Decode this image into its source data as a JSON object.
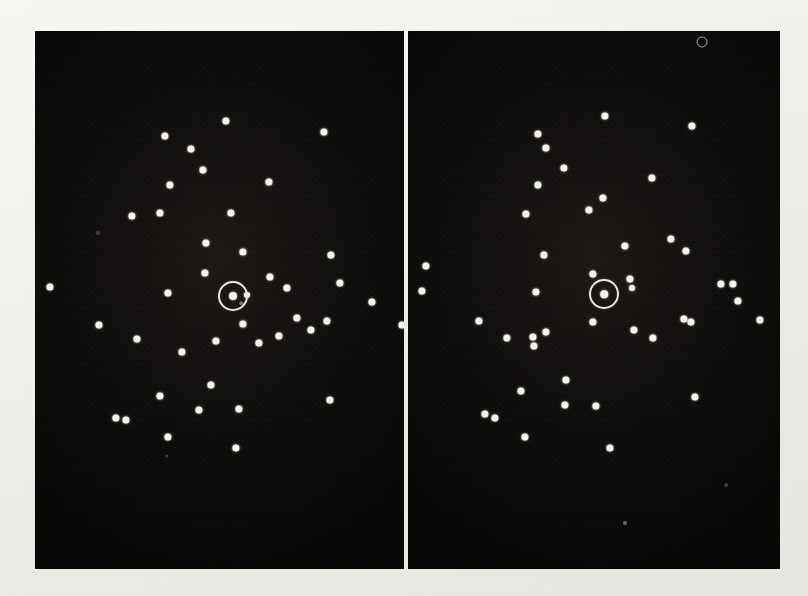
{
  "figure": {
    "kind": "electron-diffraction-plate",
    "width": 808,
    "height": 596,
    "paper_color": "#f1f0ec",
    "panel_color": "#0d0c0b",
    "spot_color": "#f4f3f0",
    "marker_color": "#ece9e3",
    "caption": "",
    "panel_count": 2
  },
  "panels": [
    {
      "id": "left-panel",
      "label": "",
      "x": 35,
      "y": 31,
      "width": 369,
      "height": 538,
      "marker": {
        "cx": 233,
        "cy": 296,
        "r": 13,
        "label": ""
      },
      "spots": [
        {
          "x": 165,
          "y": 136,
          "r": 3.6
        },
        {
          "x": 226,
          "y": 121,
          "r": 3.6
        },
        {
          "x": 324,
          "y": 132,
          "r": 3.6
        },
        {
          "x": 191,
          "y": 149,
          "r": 3.6
        },
        {
          "x": 203,
          "y": 170,
          "r": 3.6
        },
        {
          "x": 269,
          "y": 182,
          "r": 3.6
        },
        {
          "x": 170,
          "y": 185,
          "r": 3.6
        },
        {
          "x": 231,
          "y": 213,
          "r": 3.6
        },
        {
          "x": 160,
          "y": 213,
          "r": 3.6
        },
        {
          "x": 243,
          "y": 252,
          "r": 3.6
        },
        {
          "x": 331,
          "y": 255,
          "r": 3.6
        },
        {
          "x": 132,
          "y": 216,
          "r": 3.6
        },
        {
          "x": 206,
          "y": 243,
          "r": 3.6
        },
        {
          "x": 98,
          "y": 233,
          "r": 2.0,
          "class": "vfaint"
        },
        {
          "x": 270,
          "y": 277,
          "r": 3.6
        },
        {
          "x": 287,
          "y": 288,
          "r": 3.6
        },
        {
          "x": 340,
          "y": 283,
          "r": 3.6
        },
        {
          "x": 372,
          "y": 302,
          "r": 3.6
        },
        {
          "x": 205,
          "y": 273,
          "r": 3.6
        },
        {
          "x": 168,
          "y": 293,
          "r": 3.6
        },
        {
          "x": 233,
          "y": 296,
          "r": 4.0
        },
        {
          "x": 247,
          "y": 295,
          "r": 3.0
        },
        {
          "x": 241,
          "y": 303,
          "r": 1.8,
          "class": "faint"
        },
        {
          "x": 50,
          "y": 287,
          "r": 3.6
        },
        {
          "x": 99,
          "y": 325,
          "r": 3.6
        },
        {
          "x": 137,
          "y": 339,
          "r": 3.6
        },
        {
          "x": 243,
          "y": 324,
          "r": 3.6
        },
        {
          "x": 279,
          "y": 336,
          "r": 3.6
        },
        {
          "x": 311,
          "y": 330,
          "r": 3.6
        },
        {
          "x": 216,
          "y": 341,
          "r": 3.6
        },
        {
          "x": 182,
          "y": 352,
          "r": 3.6
        },
        {
          "x": 327,
          "y": 321,
          "r": 3.6
        },
        {
          "x": 259,
          "y": 343,
          "r": 3.6
        },
        {
          "x": 297,
          "y": 318,
          "r": 3.6
        },
        {
          "x": 402,
          "y": 325,
          "r": 3.6
        },
        {
          "x": 211,
          "y": 385,
          "r": 3.6
        },
        {
          "x": 160,
          "y": 396,
          "r": 3.6
        },
        {
          "x": 199,
          "y": 410,
          "r": 3.6
        },
        {
          "x": 239,
          "y": 409,
          "r": 3.6
        },
        {
          "x": 116,
          "y": 418,
          "r": 3.6
        },
        {
          "x": 126,
          "y": 420,
          "r": 3.6
        },
        {
          "x": 330,
          "y": 400,
          "r": 3.6
        },
        {
          "x": 168,
          "y": 437,
          "r": 3.6
        },
        {
          "x": 236,
          "y": 448,
          "r": 3.6
        },
        {
          "x": 167,
          "y": 456,
          "r": 1.6,
          "class": "vfaint"
        }
      ]
    },
    {
      "id": "right-panel",
      "label": "",
      "x": 408,
      "y": 31,
      "width": 372,
      "height": 538,
      "marker": {
        "cx": 604,
        "cy": 294,
        "r": 13,
        "label": ""
      },
      "spots": [
        {
          "x": 605,
          "y": 116,
          "r": 3.6
        },
        {
          "x": 692,
          "y": 126,
          "r": 3.6
        },
        {
          "x": 538,
          "y": 134,
          "r": 3.6
        },
        {
          "x": 546,
          "y": 148,
          "r": 3.6
        },
        {
          "x": 564,
          "y": 168,
          "r": 3.6
        },
        {
          "x": 652,
          "y": 178,
          "r": 3.6
        },
        {
          "x": 538,
          "y": 185,
          "r": 3.6
        },
        {
          "x": 603,
          "y": 198,
          "r": 3.6
        },
        {
          "x": 589,
          "y": 210,
          "r": 3.6
        },
        {
          "x": 526,
          "y": 214,
          "r": 3.6
        },
        {
          "x": 671,
          "y": 239,
          "r": 3.6
        },
        {
          "x": 625,
          "y": 246,
          "r": 3.6
        },
        {
          "x": 686,
          "y": 251,
          "r": 3.6
        },
        {
          "x": 544,
          "y": 255,
          "r": 3.6
        },
        {
          "x": 426,
          "y": 266,
          "r": 3.6
        },
        {
          "x": 593,
          "y": 274,
          "r": 3.6
        },
        {
          "x": 630,
          "y": 279,
          "r": 3.6
        },
        {
          "x": 632,
          "y": 288,
          "r": 3.0
        },
        {
          "x": 604,
          "y": 294,
          "r": 3.8
        },
        {
          "x": 422,
          "y": 291,
          "r": 3.6
        },
        {
          "x": 721,
          "y": 284,
          "r": 3.6
        },
        {
          "x": 733,
          "y": 284,
          "r": 3.6
        },
        {
          "x": 738,
          "y": 301,
          "r": 3.6
        },
        {
          "x": 536,
          "y": 292,
          "r": 3.6
        },
        {
          "x": 593,
          "y": 322,
          "r": 3.6
        },
        {
          "x": 479,
          "y": 321,
          "r": 3.6
        },
        {
          "x": 546,
          "y": 332,
          "r": 3.6
        },
        {
          "x": 684,
          "y": 319,
          "r": 3.6
        },
        {
          "x": 691,
          "y": 322,
          "r": 3.6
        },
        {
          "x": 760,
          "y": 320,
          "r": 3.6
        },
        {
          "x": 507,
          "y": 338,
          "r": 3.6
        },
        {
          "x": 534,
          "y": 346,
          "r": 3.6
        },
        {
          "x": 634,
          "y": 330,
          "r": 3.6
        },
        {
          "x": 653,
          "y": 338,
          "r": 3.6
        },
        {
          "x": 533,
          "y": 337,
          "r": 3.6
        },
        {
          "x": 566,
          "y": 380,
          "r": 3.6
        },
        {
          "x": 521,
          "y": 391,
          "r": 3.6
        },
        {
          "x": 565,
          "y": 405,
          "r": 3.6
        },
        {
          "x": 596,
          "y": 406,
          "r": 3.6
        },
        {
          "x": 695,
          "y": 397,
          "r": 3.6
        },
        {
          "x": 485,
          "y": 414,
          "r": 3.6
        },
        {
          "x": 495,
          "y": 418,
          "r": 3.6
        },
        {
          "x": 525,
          "y": 437,
          "r": 3.6
        },
        {
          "x": 610,
          "y": 448,
          "r": 3.6
        },
        {
          "x": 726,
          "y": 485,
          "r": 1.8,
          "class": "vfaint"
        },
        {
          "x": 625,
          "y": 523,
          "r": 2.0,
          "class": "faint"
        }
      ],
      "artifacts": [
        {
          "type": "ring-artifact",
          "x": 702,
          "y": 42,
          "r": 4.5
        }
      ]
    }
  ]
}
